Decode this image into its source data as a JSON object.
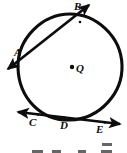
{
  "figure": {
    "kind": "circle-with-secant-and-tangent",
    "background_color": "#ffffff",
    "ink_color": "#0d0d0d",
    "width": 127,
    "height": 153,
    "center_label": "Q",
    "point_labels": {
      "A": "A",
      "B": "B",
      "Q": "Q",
      "C": "C",
      "D": "D",
      "E": "E"
    },
    "elements": {
      "circle_name": "circle Q",
      "secant_name": "secant line through A and B",
      "tangent_name": "tangent line through C, D and E",
      "center_dot_name": "center point Q"
    }
  },
  "geometry": {
    "circle": {
      "center_x": 70,
      "center_y": 67,
      "radius_x": 52,
      "radius_y": 53
    },
    "center_dot": {
      "x": 72,
      "y": 67,
      "r": 2.1
    },
    "secant": {
      "start_x": 4,
      "start_y": 72,
      "end_x": 92,
      "end_y": 3,
      "point_a_x": 28,
      "point_a_y": 53,
      "point_b_x": 80,
      "point_b_y": 22
    },
    "tangent": {
      "start_x": 14,
      "start_y": 112,
      "end_x": 123,
      "end_y": 124,
      "point_c_x": 38,
      "point_c_y": 115,
      "point_d_x": 64,
      "point_d_y": 118,
      "point_e_x": 105,
      "point_e_y": 122
    }
  }
}
